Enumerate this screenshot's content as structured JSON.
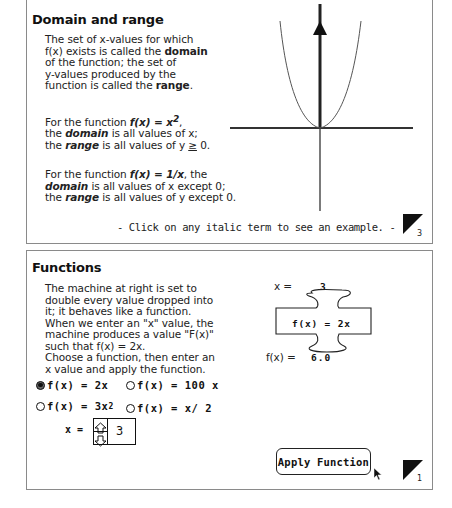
{
  "top_card": {
    "title": "Domain and range",
    "intro": [
      "The set of x-values for which",
      "f(x) exists is called the ",
      "domain",
      "of the function; the set of",
      "y-values produced by the",
      "function is called the ",
      "range",
      "."
    ],
    "example1": {
      "prefix": "For the function ",
      "func": "f(x) = x",
      "sup": "2",
      "suffix": ",",
      "line2_pre": "the ",
      "domain_term": "domain",
      "line2_post": " is all values of x;",
      "line3_pre": "the ",
      "range_term": "range",
      "line3_post": " is all values of y ",
      "geq": "≥",
      "line3_end": " 0."
    },
    "example2": {
      "prefix": "For the function ",
      "func": "f(x) = 1/x",
      "suffix": ", the",
      "domain_term": "domain",
      "line2_post": " is all values of x except 0;",
      "line3_pre": "the ",
      "range_term": "range",
      "line3_post": " is all values of y except 0."
    },
    "hint": "- Click on any italic term to see an example. -",
    "page_number": "3"
  },
  "bottom_card": {
    "title": "Functions",
    "description": [
      "The machine at right is set to",
      "double every value dropped into",
      "it; it behaves like a function.",
      "When we enter an \"x\" value, the",
      "machine produces a value \"F(x)\"",
      "such that f(x) = 2x.",
      "Choose a function, then enter an",
      "x value and apply the function."
    ],
    "machine": {
      "x_label": "x =",
      "x_value": "3",
      "function_label": "f(x) = 2x",
      "fx_label": "f(x) =",
      "fx_value": "6.0"
    },
    "options": [
      {
        "label": "f(x) = 2x",
        "selected": true
      },
      {
        "label": "f(x) = 100 x",
        "selected": false
      },
      {
        "label": "f(x) = 3x",
        "sup": "2",
        "selected": false
      },
      {
        "label": "f(x) = x/ 2",
        "selected": false
      }
    ],
    "x_input": {
      "label": "x =",
      "value": "3"
    },
    "apply_label": "Apply Function",
    "page_number": "1"
  }
}
